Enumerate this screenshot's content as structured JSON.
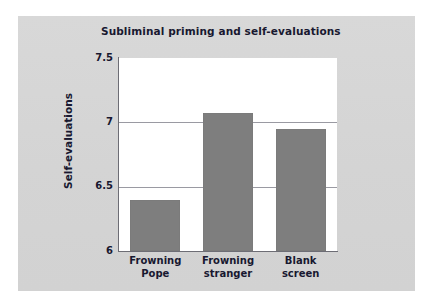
{
  "figure": {
    "panel_background": "#d6d6d6",
    "plot_background": "#ffffff",
    "bar_color": "#7e7e7e",
    "text_color": "#181830",
    "axis_color": "#6d6d75",
    "gridline_color": "#9a9aa2"
  },
  "chart_data": {
    "type": "bar",
    "title": "Subliminal priming and self-evaluations",
    "xlabel": "",
    "ylabel": "Self-evaluations",
    "categories": [
      "Frowning Pope",
      "Frowning stranger",
      "Blank screen"
    ],
    "category_lines": [
      [
        "Frowning",
        "Pope"
      ],
      [
        "Frowning",
        "stranger"
      ],
      [
        "Blank",
        "screen"
      ]
    ],
    "values": [
      6.4,
      7.07,
      6.95
    ],
    "ylim": [
      6,
      7.5
    ],
    "yticks": [
      6,
      6.5,
      7,
      7.5
    ],
    "ytick_labels": [
      "6",
      "6.5",
      "7",
      "7.5"
    ],
    "gridlines": [
      6.5,
      7
    ],
    "grid": true,
    "legend": null,
    "legend_position": "none"
  }
}
